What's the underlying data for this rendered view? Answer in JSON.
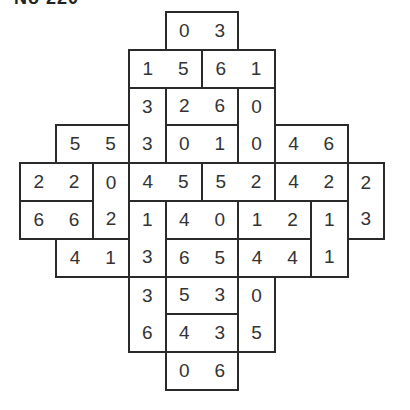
{
  "title": "No 220",
  "grid": {
    "rows": 10,
    "cols": 10,
    "origin_x": 20,
    "origin_y": 12,
    "cell_w": 36.4,
    "cell_h": 37.8
  },
  "dominoes": [
    {
      "r": 0,
      "c": 4,
      "o": "h",
      "a": "0",
      "b": "3"
    },
    {
      "r": 1,
      "c": 3,
      "o": "h",
      "a": "1",
      "b": "5"
    },
    {
      "r": 1,
      "c": 5,
      "o": "h",
      "a": "6",
      "b": "1"
    },
    {
      "r": 2,
      "c": 3,
      "o": "v",
      "a": "3",
      "b": "3"
    },
    {
      "r": 2,
      "c": 4,
      "o": "h",
      "a": "2",
      "b": "6"
    },
    {
      "r": 2,
      "c": 6,
      "o": "v",
      "a": "0",
      "b": "0"
    },
    {
      "r": 3,
      "c": 1,
      "o": "h",
      "a": "5",
      "b": "5"
    },
    {
      "r": 3,
      "c": 4,
      "o": "h",
      "a": "0",
      "b": "1"
    },
    {
      "r": 3,
      "c": 7,
      "o": "h",
      "a": "4",
      "b": "6"
    },
    {
      "r": 4,
      "c": 0,
      "o": "h",
      "a": "2",
      "b": "2"
    },
    {
      "r": 4,
      "c": 2,
      "o": "v",
      "a": "0",
      "b": "2"
    },
    {
      "r": 4,
      "c": 3,
      "o": "h",
      "a": "4",
      "b": "5"
    },
    {
      "r": 4,
      "c": 5,
      "o": "h",
      "a": "5",
      "b": "2"
    },
    {
      "r": 4,
      "c": 7,
      "o": "h",
      "a": "4",
      "b": "2"
    },
    {
      "r": 4,
      "c": 9,
      "o": "v",
      "a": "2",
      "b": "3"
    },
    {
      "r": 5,
      "c": 0,
      "o": "h",
      "a": "6",
      "b": "6"
    },
    {
      "r": 5,
      "c": 3,
      "o": "v",
      "a": "1",
      "b": "3"
    },
    {
      "r": 5,
      "c": 4,
      "o": "h",
      "a": "4",
      "b": "0"
    },
    {
      "r": 5,
      "c": 6,
      "o": "h",
      "a": "1",
      "b": "2"
    },
    {
      "r": 5,
      "c": 8,
      "o": "v",
      "a": "1",
      "b": "1"
    },
    {
      "r": 6,
      "c": 1,
      "o": "h",
      "a": "4",
      "b": "1"
    },
    {
      "r": 6,
      "c": 4,
      "o": "h",
      "a": "6",
      "b": "5"
    },
    {
      "r": 6,
      "c": 6,
      "o": "h",
      "a": "4",
      "b": "4"
    },
    {
      "r": 7,
      "c": 3,
      "o": "v",
      "a": "3",
      "b": "6"
    },
    {
      "r": 7,
      "c": 4,
      "o": "h",
      "a": "5",
      "b": "3"
    },
    {
      "r": 7,
      "c": 6,
      "o": "v",
      "a": "0",
      "b": "5"
    },
    {
      "r": 8,
      "c": 4,
      "o": "h",
      "a": "4",
      "b": "3"
    },
    {
      "r": 9,
      "c": 4,
      "o": "h",
      "a": "0",
      "b": "6"
    }
  ]
}
